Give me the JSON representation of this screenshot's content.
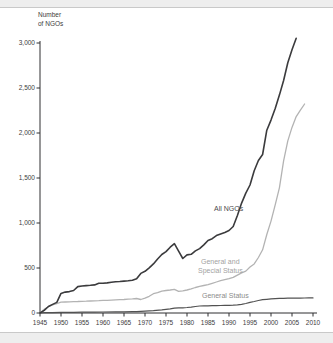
{
  "page": {
    "background": "#ffffff",
    "edge_strip_color": "#eeeeee",
    "edge_line_color": "#c9c9c9"
  },
  "chart_data": {
    "type": "line",
    "title_lines": [
      "Number",
      "of NGOs"
    ],
    "xlabel": "",
    "ylabel": "Number of NGOs",
    "xlim": [
      1945,
      2010
    ],
    "ylim": [
      0,
      3000
    ],
    "grid": false,
    "legend_position": "inline-labels",
    "x_ticks": [
      1945,
      1950,
      1955,
      1960,
      1965,
      1970,
      1975,
      1980,
      1985,
      1990,
      1995,
      2000,
      2005,
      2010
    ],
    "y_ticks": [
      {
        "value": 0,
        "label": "0"
      },
      {
        "value": 500,
        "label": "500"
      },
      {
        "value": 1000,
        "label": "1,000"
      },
      {
        "value": 1500,
        "label": "1,500"
      },
      {
        "value": 2000,
        "label": "2,000"
      },
      {
        "value": 2500,
        "label": "2,500"
      },
      {
        "value": 3000,
        "label": "3,000"
      }
    ],
    "axis_color": "#2e2e30",
    "tick_label_color": "#3c3c3c",
    "series": [
      {
        "id": "general-special",
        "name": "General and Special Status",
        "color": "#b3b3b3",
        "width": 1.3,
        "points": [
          [
            1945,
            0
          ],
          [
            1946,
            42
          ],
          [
            1947,
            70
          ],
          [
            1948,
            90
          ],
          [
            1949,
            104
          ],
          [
            1950,
            120
          ],
          [
            1951,
            122
          ],
          [
            1952,
            125
          ],
          [
            1953,
            127
          ],
          [
            1954,
            128
          ],
          [
            1955,
            130
          ],
          [
            1956,
            131
          ],
          [
            1957,
            133
          ],
          [
            1958,
            135
          ],
          [
            1959,
            137
          ],
          [
            1960,
            140
          ],
          [
            1961,
            141
          ],
          [
            1962,
            143
          ],
          [
            1963,
            145
          ],
          [
            1964,
            148
          ],
          [
            1965,
            150
          ],
          [
            1966,
            153
          ],
          [
            1967,
            157
          ],
          [
            1968,
            161
          ],
          [
            1969,
            150
          ],
          [
            1970,
            166
          ],
          [
            1971,
            186
          ],
          [
            1972,
            214
          ],
          [
            1973,
            226
          ],
          [
            1974,
            243
          ],
          [
            1975,
            250
          ],
          [
            1976,
            256
          ],
          [
            1977,
            262
          ],
          [
            1978,
            241
          ],
          [
            1979,
            247
          ],
          [
            1980,
            256
          ],
          [
            1981,
            268
          ],
          [
            1982,
            283
          ],
          [
            1983,
            295
          ],
          [
            1984,
            306
          ],
          [
            1985,
            316
          ],
          [
            1986,
            330
          ],
          [
            1987,
            344
          ],
          [
            1988,
            359
          ],
          [
            1989,
            370
          ],
          [
            1990,
            381
          ],
          [
            1991,
            396
          ],
          [
            1992,
            421
          ],
          [
            1993,
            445
          ],
          [
            1994,
            466
          ],
          [
            1995,
            511
          ],
          [
            1996,
            546
          ],
          [
            1997,
            617
          ],
          [
            1998,
            702
          ],
          [
            1999,
            872
          ],
          [
            2000,
            1021
          ],
          [
            2001,
            1202
          ],
          [
            2002,
            1391
          ],
          [
            2003,
            1691
          ],
          [
            2004,
            1912
          ],
          [
            2005,
            2062
          ],
          [
            2006,
            2182
          ],
          [
            2007,
            2253
          ],
          [
            2008,
            2322
          ]
        ]
      },
      {
        "id": "general",
        "name": "General Status",
        "color": "#525252",
        "width": 1.2,
        "points": [
          [
            1945,
            0
          ],
          [
            1946,
            3
          ],
          [
            1948,
            5
          ],
          [
            1950,
            7
          ],
          [
            1953,
            8
          ],
          [
            1955,
            9
          ],
          [
            1958,
            10
          ],
          [
            1960,
            11
          ],
          [
            1963,
            12
          ],
          [
            1965,
            13
          ],
          [
            1967,
            14
          ],
          [
            1968,
            15
          ],
          [
            1970,
            21
          ],
          [
            1972,
            27
          ],
          [
            1974,
            34
          ],
          [
            1976,
            46
          ],
          [
            1977,
            55
          ],
          [
            1978,
            57
          ],
          [
            1979,
            58
          ],
          [
            1980,
            61
          ],
          [
            1981,
            66
          ],
          [
            1982,
            72
          ],
          [
            1983,
            78
          ],
          [
            1984,
            79
          ],
          [
            1985,
            80
          ],
          [
            1986,
            81
          ],
          [
            1987,
            82
          ],
          [
            1988,
            83
          ],
          [
            1989,
            84
          ],
          [
            1990,
            86
          ],
          [
            1991,
            88
          ],
          [
            1992,
            91
          ],
          [
            1993,
            96
          ],
          [
            1994,
            106
          ],
          [
            1995,
            118
          ],
          [
            1996,
            128
          ],
          [
            1997,
            139
          ],
          [
            1998,
            148
          ],
          [
            1999,
            152
          ],
          [
            2000,
            157
          ],
          [
            2001,
            160
          ],
          [
            2002,
            162
          ],
          [
            2003,
            163
          ],
          [
            2004,
            165
          ],
          [
            2005,
            165
          ],
          [
            2006,
            166
          ],
          [
            2007,
            166
          ],
          [
            2008,
            167
          ],
          [
            2009,
            168
          ],
          [
            2010,
            168
          ]
        ]
      },
      {
        "id": "all-ngos",
        "name": "All NGOs",
        "color": "#3b3b3d",
        "width": 1.6,
        "points": [
          [
            1945,
            0
          ],
          [
            1946,
            30
          ],
          [
            1947,
            72
          ],
          [
            1948,
            95
          ],
          [
            1949,
            118
          ],
          [
            1950,
            218
          ],
          [
            1951,
            232
          ],
          [
            1952,
            238
          ],
          [
            1953,
            250
          ],
          [
            1954,
            293
          ],
          [
            1955,
            300
          ],
          [
            1956,
            305
          ],
          [
            1957,
            308
          ],
          [
            1958,
            312
          ],
          [
            1959,
            330
          ],
          [
            1960,
            331
          ],
          [
            1961,
            334
          ],
          [
            1962,
            341
          ],
          [
            1963,
            348
          ],
          [
            1964,
            350
          ],
          [
            1965,
            354
          ],
          [
            1966,
            358
          ],
          [
            1967,
            363
          ],
          [
            1968,
            380
          ],
          [
            1969,
            440
          ],
          [
            1970,
            463
          ],
          [
            1971,
            502
          ],
          [
            1972,
            546
          ],
          [
            1973,
            600
          ],
          [
            1974,
            650
          ],
          [
            1975,
            682
          ],
          [
            1976,
            731
          ],
          [
            1977,
            770
          ],
          [
            1978,
            688
          ],
          [
            1979,
            606
          ],
          [
            1980,
            645
          ],
          [
            1981,
            652
          ],
          [
            1982,
            690
          ],
          [
            1983,
            716
          ],
          [
            1984,
            757
          ],
          [
            1985,
            806
          ],
          [
            1986,
            826
          ],
          [
            1987,
            860
          ],
          [
            1988,
            879
          ],
          [
            1989,
            896
          ],
          [
            1990,
            917
          ],
          [
            1991,
            961
          ],
          [
            1992,
            1083
          ],
          [
            1993,
            1221
          ],
          [
            1994,
            1332
          ],
          [
            1995,
            1422
          ],
          [
            1996,
            1581
          ],
          [
            1997,
            1694
          ],
          [
            1998,
            1761
          ],
          [
            1999,
            2031
          ],
          [
            2000,
            2143
          ],
          [
            2001,
            2272
          ],
          [
            2002,
            2421
          ],
          [
            2003,
            2583
          ],
          [
            2004,
            2781
          ],
          [
            2005,
            2924
          ],
          [
            2006,
            3052
          ]
        ]
      }
    ],
    "labels": {
      "all_ngos": {
        "text": "All NGOs",
        "color": "#4a4a4c"
      },
      "gen_special_1": {
        "text": "General and",
        "color": "#a2a2a2"
      },
      "gen_special_2": {
        "text": "Special Status",
        "color": "#a2a2a2"
      },
      "general": {
        "text": "General Status",
        "color": "#8b8b8b"
      }
    }
  }
}
